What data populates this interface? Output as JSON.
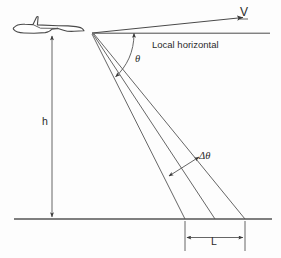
{
  "figure": {
    "background_color": "#fdfdfd",
    "line_color": "#4a4a4a",
    "labels": {
      "velocity_vector": "V",
      "local_horizontal": "Local horizontal",
      "depression_angle": "θ",
      "beamwidth": "Δθ",
      "altitude": "h",
      "footprint_length": "L"
    },
    "icons": {
      "aircraft": "aircraft-silhouette-icon",
      "velocity_arrow": "arrow-right-icon",
      "angle_arc": "angle-arc-icon",
      "dimension_arrow": "double-headed-arrow-icon"
    },
    "geometry": {
      "apex": {
        "x": 92,
        "y": 33
      },
      "ground_line_y": 219,
      "horizontal_line": {
        "x1": 92,
        "y1": 33,
        "x2": 270,
        "y2": 33
      },
      "velocity_arrow": {
        "x1": 92,
        "y1": 33,
        "x2": 245,
        "y2": 17
      },
      "beam_ground_hits": [
        185,
        215,
        245
      ],
      "altitude_line_x": 52,
      "altitude_top_y": 35,
      "footprint_span": {
        "x1": 185,
        "x2": 245,
        "y": 238
      }
    }
  }
}
